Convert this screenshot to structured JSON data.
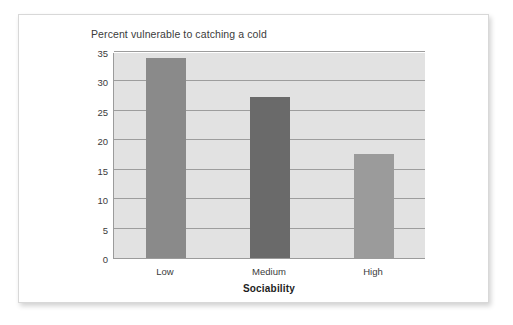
{
  "figure": {
    "title": "Percent vulnerable to catching a cold"
  },
  "chart_data": {
    "type": "bar",
    "title": "Percent vulnerable to catching a cold",
    "xlabel": "Sociability",
    "ylabel": "",
    "categories": [
      "Low",
      "Medium",
      "High"
    ],
    "values": [
      34.0,
      27.3,
      17.7
    ],
    "ylim": [
      0,
      35
    ],
    "yticks": [
      0,
      5,
      10,
      15,
      20,
      25,
      30,
      35
    ],
    "ytick_labels": [
      "0",
      "5",
      "10",
      "15",
      "20",
      "25",
      "30",
      "35"
    ],
    "grid": true,
    "legend": "none",
    "bar_colors": [
      "#8a8a8a",
      "#6a6a6a",
      "#9b9b9b"
    ],
    "plot_background": "#e2e2e2",
    "axis_color": "#9b9b9b"
  }
}
